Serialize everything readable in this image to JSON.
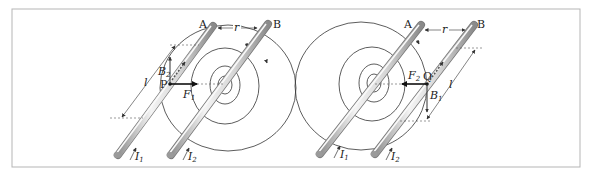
{
  "figure": {
    "frame": {
      "x": 12,
      "y": 9,
      "width": 568,
      "height": 158,
      "stroke": "#b5b5b5"
    },
    "colors": {
      "line": "#333333",
      "arrow": "#111111",
      "wire_light": "#f2f2f2",
      "wire_mid": "#cfcfcf",
      "wire_dark": "#8f8f8f",
      "dashed": "#555555"
    },
    "left_panel": {
      "wire_a_label": "A",
      "wire_b_label": "B",
      "distance_label": "r",
      "length_label": "l",
      "point_label": "P",
      "force_label": "F",
      "force_sub": "1",
      "field_label": "B",
      "field_sub": "2",
      "current_a_label": "I",
      "current_a_sub": "1",
      "current_b_label": "I",
      "current_b_sub": "2",
      "field_circles_around": "B",
      "force_direction": "right (toward B)"
    },
    "right_panel": {
      "wire_a_label": "A",
      "wire_b_label": "B",
      "distance_label": "r",
      "length_label": "l",
      "point_label": "Q",
      "force_label": "F",
      "force_sub": "2",
      "field_label": "B",
      "field_sub": "1",
      "current_a_label": "I",
      "current_a_sub": "1",
      "current_b_label": "I",
      "current_b_sub": "2",
      "field_circles_around": "A",
      "force_direction": "left (toward A)"
    }
  }
}
